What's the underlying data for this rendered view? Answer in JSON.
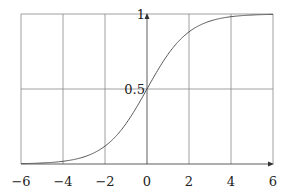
{
  "chart_data": {
    "type": "line",
    "title": "",
    "xlabel": "",
    "ylabel": "",
    "function": "sigmoid 1/(1+e^-x)",
    "xlim": [
      -6,
      6
    ],
    "ylim": [
      0,
      1
    ],
    "grid": true,
    "x_ticks": [
      -6,
      -4,
      -2,
      0,
      2,
      4,
      6
    ],
    "x_tick_labels": [
      "−6",
      "−4",
      "−2",
      "0",
      "2",
      "4",
      "6"
    ],
    "y_ticks": [
      0.5,
      1
    ],
    "y_tick_labels": [
      "0.5",
      "1"
    ],
    "series": [
      {
        "name": "sigmoid",
        "x": [
          -6,
          -5,
          -4,
          -3,
          -2,
          -1,
          0,
          1,
          2,
          3,
          4,
          5,
          6
        ],
        "values": [
          0.0025,
          0.0067,
          0.018,
          0.047,
          0.119,
          0.269,
          0.5,
          0.731,
          0.881,
          0.953,
          0.982,
          0.9933,
          0.9975
        ]
      }
    ],
    "colors": {
      "grid": "#888888",
      "curve": "#555555",
      "axis": "#333333"
    }
  }
}
